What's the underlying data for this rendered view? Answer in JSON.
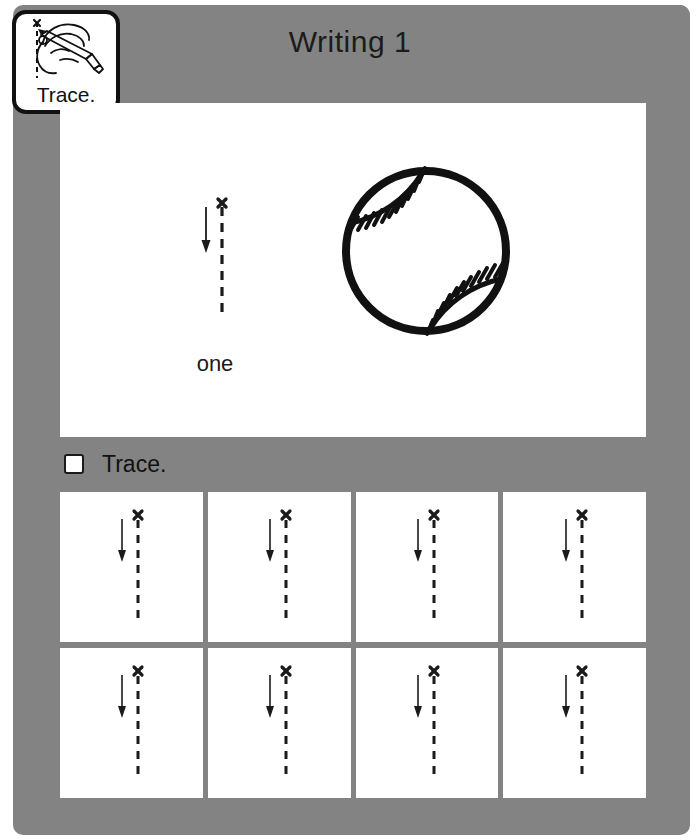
{
  "page": {
    "title": "Writing 1",
    "background_color": "#ffffff",
    "panel_color": "#838383",
    "ink_color": "#111111"
  },
  "trace_badge": {
    "label": "Trace.",
    "icon": "hand-holding-pencil-tracing-dashed-line-icon"
  },
  "header": {
    "title": "Writing 1"
  },
  "main": {
    "stroke_demo": {
      "icon": "stroke-order-dashed-vertical-line-with-x-and-down-arrow",
      "start_mark": "x",
      "direction": "down",
      "strokes": 1
    },
    "word": "one",
    "illustration": {
      "icon": "baseball-icon",
      "name": "baseball"
    }
  },
  "trace_bar": {
    "checkbox": "unchecked-checkbox",
    "label": "Trace."
  },
  "practice": {
    "rows": [
      {
        "cells": [
          {
            "icon": "trace-guide-vertical-line-icon",
            "start_mark": "x"
          },
          {
            "icon": "trace-guide-vertical-line-icon",
            "start_mark": "x"
          },
          {
            "icon": "trace-guide-vertical-line-icon",
            "start_mark": "x"
          },
          {
            "icon": "trace-guide-vertical-line-icon",
            "start_mark": "x"
          }
        ]
      },
      {
        "cells": [
          {
            "icon": "trace-guide-vertical-line-icon",
            "start_mark": "x"
          },
          {
            "icon": "trace-guide-vertical-line-icon",
            "start_mark": "x"
          },
          {
            "icon": "trace-guide-vertical-line-icon",
            "start_mark": "x"
          },
          {
            "icon": "trace-guide-vertical-line-icon",
            "start_mark": "x"
          }
        ]
      }
    ]
  }
}
